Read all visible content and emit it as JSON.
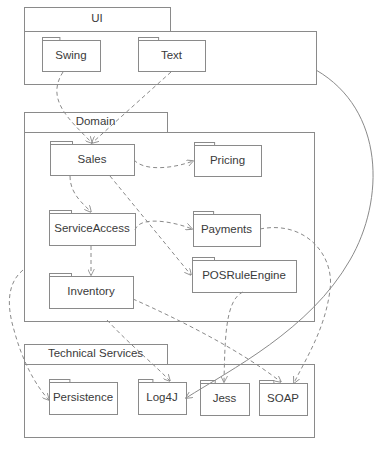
{
  "diagram": {
    "type": "UML package diagram",
    "colors": {
      "line": "#8a8a8a",
      "text": "#3a3a3a",
      "background": "#ffffff"
    },
    "layers": [
      {
        "id": "ui",
        "name": "UI",
        "tab": {
          "x": 24,
          "y": 7,
          "w": 146,
          "h": 24
        },
        "body": {
          "x": 24,
          "y": 31,
          "w": 292,
          "h": 53
        },
        "packages": [
          {
            "id": "swing",
            "name": "Swing",
            "x": 42,
            "y": 40,
            "w": 58,
            "h": 31
          },
          {
            "id": "text",
            "name": "Text",
            "x": 138,
            "y": 40,
            "w": 67,
            "h": 31
          }
        ]
      },
      {
        "id": "domain",
        "name": "Domain",
        "tab": {
          "x": 24,
          "y": 112,
          "w": 143,
          "h": 20
        },
        "body": {
          "x": 24,
          "y": 132,
          "w": 290,
          "h": 189
        },
        "packages": [
          {
            "id": "sales",
            "name": "Sales",
            "x": 50,
            "y": 144,
            "w": 84,
            "h": 31
          },
          {
            "id": "pricing",
            "name": "Pricing",
            "x": 194,
            "y": 145,
            "w": 67,
            "h": 31
          },
          {
            "id": "serviceaccess",
            "name": "ServiceAccess",
            "x": 49,
            "y": 213,
            "w": 86,
            "h": 32
          },
          {
            "id": "payments",
            "name": "Payments",
            "x": 193,
            "y": 214,
            "w": 67,
            "h": 32
          },
          {
            "id": "inventory",
            "name": "Inventory",
            "x": 49,
            "y": 276,
            "w": 84,
            "h": 32
          },
          {
            "id": "posruleengine",
            "name": "POSRuleEngine",
            "x": 192,
            "y": 260,
            "w": 104,
            "h": 32
          }
        ]
      },
      {
        "id": "technical-services",
        "name": "Technical Services",
        "tab": {
          "x": 24,
          "y": 344,
          "w": 143,
          "h": 20
        },
        "body": {
          "x": 24,
          "y": 364,
          "w": 290,
          "h": 73
        },
        "packages": [
          {
            "id": "persistence",
            "name": "Persistence",
            "x": 49,
            "y": 382,
            "w": 68,
            "h": 32
          },
          {
            "id": "log4j",
            "name": "Log4J",
            "x": 138,
            "y": 382,
            "w": 48,
            "h": 32
          },
          {
            "id": "jess",
            "name": "Jess",
            "x": 200,
            "y": 383,
            "w": 49,
            "h": 32
          },
          {
            "id": "soap",
            "name": "SOAP",
            "x": 259,
            "y": 383,
            "w": 48,
            "h": 32
          }
        ]
      }
    ],
    "dependencies": [
      {
        "from": "Swing",
        "to": "Sales",
        "style": "dashed",
        "path": "M63 72 C45 100, 70 120, 92 143"
      },
      {
        "from": "Text",
        "to": "Sales",
        "style": "dashed",
        "path": "M171 72 L92 143"
      },
      {
        "from": "Sales",
        "to": "Pricing",
        "style": "dashed",
        "path": "M134 160 C145 172, 175 168, 193 161"
      },
      {
        "from": "Sales",
        "to": "ServiceAccess",
        "style": "dashed",
        "path": "M70 176 C70 195, 85 205, 91 212"
      },
      {
        "from": "Sales",
        "to": "POSRuleEngine",
        "style": "dashed",
        "path": "M110 176 L191 275"
      },
      {
        "from": "ServiceAccess",
        "to": "Payments",
        "style": "dashed",
        "path": "M135 230 C140 215, 175 222, 192 229"
      },
      {
        "from": "ServiceAccess",
        "to": "Inventory",
        "style": "dashed",
        "path": "M91 246 L91 275"
      },
      {
        "from": "Payments",
        "to": "SOAP",
        "style": "dashed",
        "path": "M260 229 C305 220, 335 255, 330 290 C325 330, 305 360, 294 383"
      },
      {
        "from": "POSRuleEngine",
        "to": "Jess",
        "style": "dashed",
        "path": "M243 292 C225 300, 225 340, 224 382"
      },
      {
        "from": "Inventory",
        "to": "SOAP",
        "style": "dashed",
        "path": "M133 299 C180 320, 240 350, 281 382"
      },
      {
        "from": "Domain",
        "to": "Persistence",
        "style": "dashed",
        "path": "M23 270 C5 285, 8 310, 14 330 C22 360, 35 385, 49 400"
      },
      {
        "from": "Domain",
        "to": "Log4J",
        "style": "dashed",
        "path": "M107 320 C130 345, 155 365, 170 381"
      },
      {
        "from": "UI",
        "to": "Log4J",
        "style": "solid",
        "path": "M316 70 C385 110, 385 200, 350 260 C310 330, 230 370, 186 398"
      }
    ]
  }
}
